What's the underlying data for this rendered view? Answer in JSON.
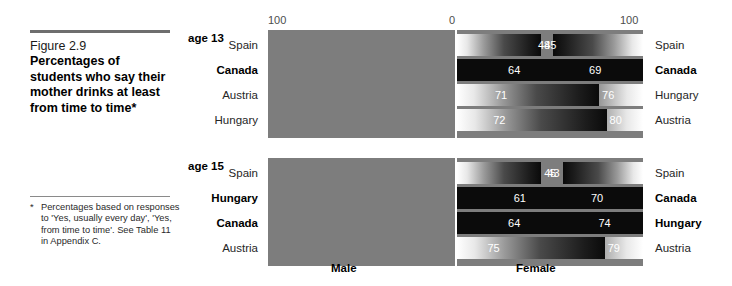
{
  "caption": {
    "figure_number": "Figure 2.9",
    "title": "Percentages of students who say their mother drinks at least from time to time*"
  },
  "footnote": {
    "marker": "*",
    "text": "Percentages based on responses to 'Yes, usually every day', 'Yes, from time to time'. See Table 11 in Appendix C."
  },
  "axis": {
    "left_tick": "100",
    "center_tick": "0",
    "right_tick": "100"
  },
  "legend": {
    "male": "Male",
    "female": "Female"
  },
  "groups": [
    {
      "age_label": "age 13",
      "rows": [
        {
          "left_country": "Spain",
          "male": "48",
          "right_country": "Spain",
          "female": "45",
          "highlight": false
        },
        {
          "left_country": "Canada",
          "male": "64",
          "right_country": "Canada",
          "female": "69",
          "highlight": true
        },
        {
          "left_country": "Austria",
          "male": "71",
          "right_country": "Hungary",
          "female": "76",
          "highlight": false
        },
        {
          "left_country": "Hungary",
          "male": "72",
          "right_country": "Austria",
          "female": "80",
          "highlight": false
        }
      ]
    },
    {
      "age_label": "age 15",
      "rows": [
        {
          "left_country": "Spain",
          "male": "43",
          "right_country": "Spain",
          "female": "45",
          "highlight": false
        },
        {
          "left_country": "Hungary",
          "male": "61",
          "right_country": "Canada",
          "female": "70",
          "highlight": true
        },
        {
          "left_country": "Canada",
          "male": "64",
          "right_country": "Hungary",
          "female": "74",
          "highlight": true
        },
        {
          "left_country": "Austria",
          "male": "75",
          "right_country": "Austria",
          "female": "79",
          "highlight": false
        }
      ]
    }
  ],
  "chart_data": {
    "type": "bar",
    "orientation": "horizontal-diverging",
    "title": "Percentages of students who say their mother drinks at least from time to time",
    "xlabel": "",
    "ylabel": "",
    "xlim_left": [
      100,
      0
    ],
    "xlim_right": [
      0,
      100
    ],
    "grid": false,
    "legend_position": "bottom",
    "series": [
      {
        "name": "Male",
        "axis": "left"
      },
      {
        "name": "Female",
        "axis": "right"
      }
    ],
    "panels": [
      {
        "name": "age 13",
        "male": {
          "categories": [
            "Spain",
            "Canada",
            "Austria",
            "Hungary"
          ],
          "values": [
            48,
            64,
            71,
            72
          ]
        },
        "female": {
          "categories": [
            "Spain",
            "Canada",
            "Hungary",
            "Austria"
          ],
          "values": [
            45,
            69,
            76,
            80
          ]
        }
      },
      {
        "name": "age 15",
        "male": {
          "categories": [
            "Spain",
            "Hungary",
            "Canada",
            "Austria"
          ],
          "values": [
            43,
            61,
            64,
            75
          ]
        },
        "female": {
          "categories": [
            "Spain",
            "Canada",
            "Hungary",
            "Austria"
          ],
          "values": [
            45,
            70,
            74,
            79
          ]
        }
      }
    ],
    "highlighted_country": "Canada"
  }
}
